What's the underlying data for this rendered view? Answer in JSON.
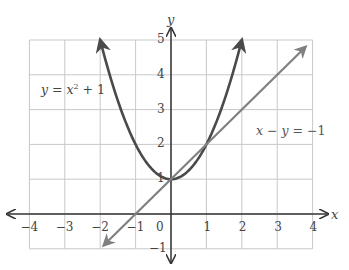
{
  "chart_data": {
    "type": "line",
    "title": "",
    "xlabel": "x",
    "ylabel": "y",
    "xlim": [
      -4,
      4
    ],
    "ylim": [
      -1,
      5
    ],
    "grid": true,
    "x_ticks": [
      "-4",
      "-3",
      "-2",
      "-1",
      "0",
      "1",
      "2",
      "3",
      "4"
    ],
    "y_ticks": [
      "-1",
      "1",
      "2",
      "3",
      "4",
      "5"
    ],
    "series": [
      {
        "name": "y = x² + 1",
        "kind": "curve",
        "equation": "y = x^2 + 1",
        "x_range": [
          -2,
          2
        ],
        "points": [
          [
            -2,
            5
          ],
          [
            -1.5,
            3.25
          ],
          [
            -1,
            2
          ],
          [
            -0.5,
            1.25
          ],
          [
            0,
            1
          ],
          [
            0.5,
            1.25
          ],
          [
            1,
            2
          ],
          [
            1.5,
            3.25
          ],
          [
            2,
            5
          ]
        ],
        "color": "#4a4a4a",
        "arrows": "both"
      },
      {
        "name": "x − y = −1",
        "kind": "line",
        "equation": "y = x + 1",
        "points": [
          [
            -1.9,
            -0.9
          ],
          [
            3.8,
            4.8
          ]
        ],
        "color": "#808080",
        "arrows": "both"
      }
    ],
    "annotations": [
      {
        "text": "y = x² + 1",
        "x": -3.6,
        "y": 3.7
      },
      {
        "text": "x − y = −1",
        "x": 2.6,
        "y": 2.6
      }
    ]
  },
  "labels": {
    "x_axis": "x",
    "y_axis": "y",
    "parabola_label": {
      "y": "y",
      "eq": " = ",
      "x": "x",
      "sup": "2",
      "rest": " + 1"
    },
    "line_label": {
      "x": "x",
      "minus": " − ",
      "y": "y",
      "rest": " = −1"
    },
    "x_ticks": [
      "−4",
      "−3",
      "−2",
      "−1",
      "0",
      "1",
      "2",
      "3",
      "4"
    ],
    "y_ticks": [
      "5",
      "4",
      "3",
      "2",
      "1",
      "−1"
    ]
  }
}
